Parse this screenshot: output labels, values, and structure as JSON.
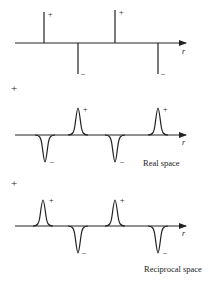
{
  "panels": [
    {
      "id": "delta",
      "axis_label": "r",
      "peaks": [
        {
          "x": 44,
          "sign": "+",
          "label": "+"
        },
        {
          "x": 78,
          "sign": "-",
          "label": "–"
        },
        {
          "x": 115,
          "sign": "+",
          "label": "+"
        },
        {
          "x": 158,
          "sign": "-",
          "label": "–"
        }
      ]
    },
    {
      "id": "real",
      "side_marker": "+",
      "axis_label": "r",
      "caption": "Real space",
      "peaks": [
        {
          "x": 45,
          "sign": "-",
          "label": "–"
        },
        {
          "x": 78,
          "sign": "+",
          "label": "+"
        },
        {
          "x": 115,
          "sign": "-",
          "label": "–"
        },
        {
          "x": 158,
          "sign": "+",
          "label": "+"
        }
      ]
    },
    {
      "id": "reciprocal",
      "side_marker": "+",
      "axis_label": "r",
      "caption": "Reciprocal space",
      "peaks": [
        {
          "x": 43,
          "sign": "+",
          "label": "+"
        },
        {
          "x": 78,
          "sign": "-",
          "label": "–"
        },
        {
          "x": 115,
          "sign": "+",
          "label": "+"
        },
        {
          "x": 158,
          "sign": "-",
          "label": "–"
        }
      ]
    }
  ]
}
